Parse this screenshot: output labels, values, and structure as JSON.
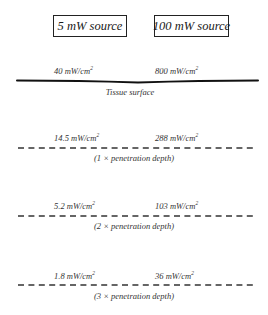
{
  "sources": [
    {
      "label": "5 mW source"
    },
    {
      "label": "100 mW source"
    }
  ],
  "unit": "mW/cm",
  "unit_superscript": "2",
  "surface": {
    "label": "Tissue surface",
    "values": [
      "40",
      "800"
    ]
  },
  "depths": [
    {
      "caption": "(1 × penetration depth)",
      "values": [
        "14.5",
        "288"
      ]
    },
    {
      "caption": "(2 × penetration depth)",
      "values": [
        "5.2",
        "103"
      ]
    },
    {
      "caption": "(3 × penetration depth)",
      "values": [
        "1.8",
        "36"
      ]
    }
  ]
}
